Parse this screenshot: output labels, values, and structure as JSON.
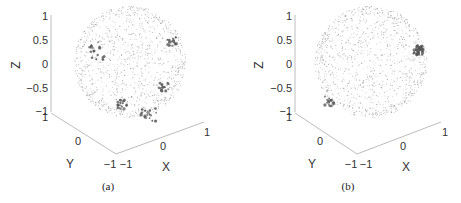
{
  "chart_data": [
    {
      "type": "scatter",
      "subtype": "3d-scatter-on-unit-sphere",
      "caption": "(a)",
      "xlabel": "X",
      "ylabel": "Y",
      "zlabel": "Z",
      "xlim": [
        -1,
        1
      ],
      "ylim": [
        -1,
        1
      ],
      "zlim": [
        -1,
        1
      ],
      "xticks": [
        "-1",
        "0",
        "1"
      ],
      "yticks": [
        "-1",
        "0",
        "1"
      ],
      "zticks": [
        "-1",
        "-0.5",
        "0",
        "0.5",
        "1"
      ],
      "grid": false,
      "description": "Dense light-gray points uniformly covering a unit sphere; darker larger markers form clusters along the left limb arc, a ring-shaped cluster near lower-center, a cluster at right-middle, and a cluster at upper-right.",
      "clusters": [
        {
          "name": "upper-right",
          "approx_view_pos": [
            0.75,
            0.35
          ]
        },
        {
          "name": "right-middle",
          "approx_view_pos": [
            0.6,
            -0.45
          ]
        },
        {
          "name": "lower-center-ring",
          "approx_view_pos": [
            -0.15,
            -0.75
          ]
        },
        {
          "name": "bottom-right-arc",
          "approx_view_pos": [
            0.35,
            -0.95
          ]
        },
        {
          "name": "left-limb-arc",
          "approx_view_pos": [
            -0.6,
            0.2
          ]
        }
      ]
    },
    {
      "type": "scatter",
      "subtype": "3d-scatter-on-unit-sphere",
      "caption": "(b)",
      "xlabel": "X",
      "ylabel": "Y",
      "zlabel": "Z",
      "xlim": [
        -1,
        1
      ],
      "ylim": [
        -1,
        1
      ],
      "zlim": [
        -1,
        1
      ],
      "xticks": [
        "-1",
        "0",
        "1"
      ],
      "yticks": [
        "-1",
        "0",
        "1"
      ],
      "zticks": [
        "-1",
        "-0.5",
        "0",
        "0.5",
        "1"
      ],
      "grid": false,
      "description": "Dense light-gray points uniformly covering a unit sphere; a dense dark cluster at the upper-right limb (around Z≈0.2) and darker points along the lower-left limb.",
      "clusters": [
        {
          "name": "upper-right-dense",
          "approx_view_pos": [
            0.85,
            0.2
          ]
        },
        {
          "name": "lower-left-limb",
          "approx_view_pos": [
            -0.75,
            -0.7
          ]
        }
      ]
    }
  ],
  "panels": [
    {
      "caption": "(a)",
      "zlabel": "Z",
      "ylabel": "Y",
      "xlabel": "X",
      "zticks": [
        "1",
        "0.5",
        "0",
        "−0.5",
        "−1"
      ],
      "yticks": [
        "1",
        "0",
        "−1"
      ],
      "xticks": [
        "−1",
        "0",
        "1"
      ]
    },
    {
      "caption": "(b)",
      "zlabel": "Z",
      "ylabel": "Y",
      "xlabel": "X",
      "zticks": [
        "1",
        "0.5",
        "0",
        "−0.5",
        "−1"
      ],
      "yticks": [
        "1",
        "0",
        "−1"
      ],
      "xticks": [
        "−1",
        "0",
        "1"
      ]
    }
  ],
  "colors": {
    "background": "#ffffff",
    "axis": "#bdbdbd",
    "point_light": "#9a9a9a",
    "point_dark": "#555555",
    "text": "#333333"
  }
}
